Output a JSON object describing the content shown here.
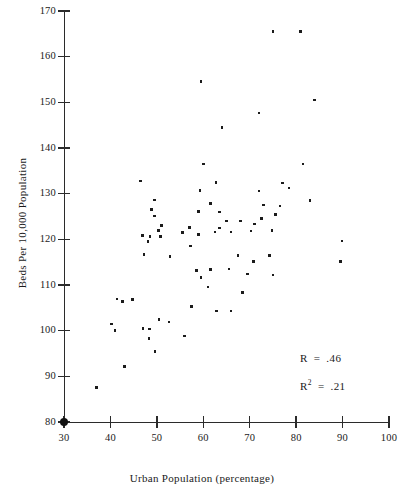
{
  "chart_data": {
    "type": "scatter",
    "title": "",
    "xlabel": "Urban Population (percentage)",
    "ylabel": "Beds Per 10,000 Population",
    "xlim": [
      30,
      100
    ],
    "ylim": [
      80,
      170
    ],
    "xticks": [
      30,
      40,
      50,
      60,
      70,
      80,
      90,
      100
    ],
    "yticks": [
      80,
      90,
      100,
      110,
      120,
      130,
      140,
      150,
      160,
      170
    ],
    "grid": false,
    "legend": null,
    "annotations": [
      {
        "name": "correlation",
        "symbol": "R",
        "operator": "=",
        "value": ".46"
      },
      {
        "name": "r-squared",
        "symbol": "R",
        "exponent": "2",
        "operator": "=",
        "value": ".21"
      }
    ],
    "marker": {
      "shape": "square",
      "color": "#1b1b1b",
      "size": 2.6
    },
    "origin_marker": {
      "x": 30,
      "y": 80,
      "shape": "filled-circle",
      "color": "#121212"
    },
    "points": [
      [
        37.0,
        87.5
      ],
      [
        43.0,
        92.2
      ],
      [
        49.6,
        95.5
      ],
      [
        48.3,
        98.3
      ],
      [
        56.0,
        98.8
      ],
      [
        40.2,
        101.5
      ],
      [
        41.0,
        100.0
      ],
      [
        47.0,
        100.5
      ],
      [
        48.4,
        100.4
      ],
      [
        50.5,
        102.4
      ],
      [
        52.6,
        101.9
      ],
      [
        41.4,
        106.9
      ],
      [
        42.6,
        106.4
      ],
      [
        44.8,
        106.8
      ],
      [
        57.5,
        105.3
      ],
      [
        62.8,
        104.3
      ],
      [
        66.0,
        104.3
      ],
      [
        68.5,
        108.3
      ],
      [
        61.0,
        109.6
      ],
      [
        59.5,
        111.7
      ],
      [
        58.5,
        113.2
      ],
      [
        61.5,
        113.4
      ],
      [
        65.5,
        113.5
      ],
      [
        69.5,
        112.4
      ],
      [
        75.0,
        112.2
      ],
      [
        89.5,
        115.2
      ],
      [
        70.8,
        115.2
      ],
      [
        47.2,
        116.7
      ],
      [
        52.8,
        116.3
      ],
      [
        67.5,
        116.5
      ],
      [
        74.2,
        116.5
      ],
      [
        57.2,
        118.5
      ],
      [
        48.1,
        119.5
      ],
      [
        48.5,
        120.6
      ],
      [
        50.8,
        120.6
      ],
      [
        89.9,
        119.6
      ],
      [
        46.9,
        120.9
      ],
      [
        50.3,
        121.9
      ],
      [
        55.5,
        121.5
      ],
      [
        59.0,
        121.0
      ],
      [
        62.5,
        121.6
      ],
      [
        66.0,
        121.6
      ],
      [
        70.3,
        121.8
      ],
      [
        74.8,
        121.9
      ],
      [
        71.0,
        123.4
      ],
      [
        51.0,
        123.0
      ],
      [
        57.0,
        122.6
      ],
      [
        63.5,
        122.5
      ],
      [
        68.0,
        124.0
      ],
      [
        65.0,
        124.0
      ],
      [
        72.5,
        124.5
      ],
      [
        49.5,
        125.1
      ],
      [
        59.0,
        126.1
      ],
      [
        63.5,
        126.0
      ],
      [
        75.5,
        125.4
      ],
      [
        48.8,
        126.5
      ],
      [
        61.5,
        127.8
      ],
      [
        73.0,
        127.5
      ],
      [
        76.5,
        127.3
      ],
      [
        49.5,
        128.6
      ],
      [
        83.0,
        128.5
      ],
      [
        59.3,
        130.7
      ],
      [
        72.0,
        130.6
      ],
      [
        78.5,
        131.2
      ],
      [
        46.5,
        132.8
      ],
      [
        62.7,
        132.4
      ],
      [
        77.0,
        132.3
      ],
      [
        60.0,
        136.5
      ],
      [
        81.5,
        136.5
      ],
      [
        64.0,
        144.5
      ],
      [
        72.0,
        147.7
      ],
      [
        59.5,
        154.5
      ],
      [
        84.0,
        150.5
      ],
      [
        75.0,
        165.5
      ],
      [
        81.0,
        165.5
      ]
    ]
  }
}
